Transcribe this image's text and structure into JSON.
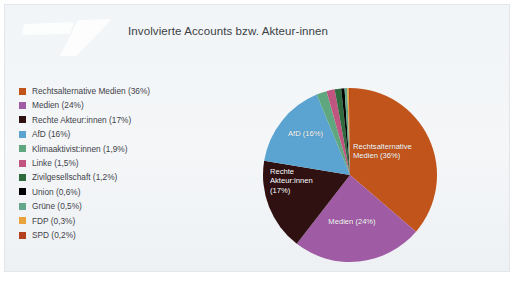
{
  "header": {
    "title": "Involvierte Accounts bzw. Akteur-innen",
    "logo_icon": "flag-swoosh-watermark-logo"
  },
  "colors": {
    "slide_background": "#f2f5f7",
    "page_background": "#ffffff",
    "title_text": "#3b3f45",
    "legend_text": "#3f4349",
    "pie_label_text": "#ffffff"
  },
  "chart_data": {
    "type": "pie",
    "title": "Involvierte Accounts bzw. Akteur-innen",
    "legend_position": "left",
    "grid": false,
    "categories": [
      "Rechtsalternative Medien",
      "Medien",
      "Rechte Akteur:innen",
      "AfD",
      "Klimaaktivist:innen",
      "Linke",
      "Zivilgesellschaft",
      "Union",
      "Grüne",
      "FDP",
      "SPD"
    ],
    "values": [
      36,
      24,
      17,
      16,
      1.9,
      1.5,
      1.2,
      0.6,
      0.5,
      0.3,
      0.2
    ],
    "value_labels": [
      "36%",
      "24%",
      "17%",
      "16%",
      "1,9%",
      "1,5%",
      "1,2%",
      "0,6%",
      "0,5%",
      "0,3%",
      "0,2%"
    ],
    "colors": [
      "#c1541a",
      "#a05ba5",
      "#2f1112",
      "#5ba3d0",
      "#5fa87f",
      "#c0557f",
      "#2f6b3e",
      "#000000",
      "#63a88d",
      "#e8a33d",
      "#b3401f"
    ],
    "legend": [
      {
        "label": "Rechtsalternative Medien (36%)",
        "color": "#c1541a"
      },
      {
        "label": "Medien (24%)",
        "color": "#a05ba5"
      },
      {
        "label": "Rechte Akteur:innen (17%)",
        "color": "#2f1112"
      },
      {
        "label": "AfD (16%)",
        "color": "#5ba3d0"
      },
      {
        "label": "Klimaaktivist:innen (1,9%)",
        "color": "#5fa87f"
      },
      {
        "label": "Linke (1,5%)",
        "color": "#c0557f"
      },
      {
        "label": "Zivilgesellschaft (1,2%)",
        "color": "#2f6b3e"
      },
      {
        "label": "Union (0,6%)",
        "color": "#000000"
      },
      {
        "label": "Grüne (0,5%)",
        "color": "#63a88d"
      },
      {
        "label": "FDP (0,3%)",
        "color": "#e8a33d"
      },
      {
        "label": "SPD (0,2%)",
        "color": "#b3401f"
      }
    ],
    "slice_labels": [
      "Rechtsalternative\nMedien (36%)",
      "Medien (24%)",
      "Rechte\nAkteur:innen\n(17%)",
      "AfD (16%)"
    ]
  }
}
